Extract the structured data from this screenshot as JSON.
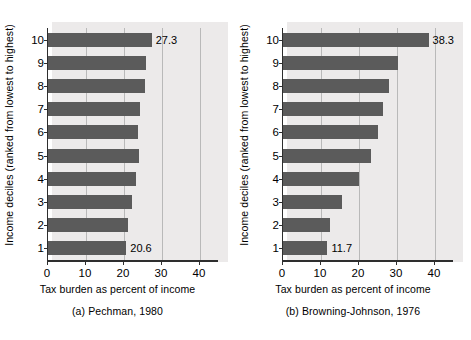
{
  "figure": {
    "background": "#ffffff",
    "bar_color": "#5b5b5b",
    "grid_color": "#b9b9b9",
    "axis_color": "#2e2e2e"
  },
  "panels": [
    {
      "key": "pechman",
      "caption": "(a) Pechman, 1980",
      "xlabel": "Tax burden as percent of income",
      "ylabel": "Income deciles (ranked from lowest to highest)"
    },
    {
      "key": "browning_johnson",
      "caption": "(b) Browning-Johnson, 1976",
      "xlabel": "Tax burden as percent of income",
      "ylabel": "Income deciles (ranked from lowest to highest)"
    }
  ],
  "chart_data": [
    {
      "type": "bar",
      "orientation": "horizontal",
      "title": "(a) Pechman, 1980",
      "xlabel": "Tax burden as percent of income",
      "ylabel": "Income deciles (ranked from lowest to highest)",
      "categories": [
        "1",
        "2",
        "3",
        "4",
        "5",
        "6",
        "7",
        "8",
        "9",
        "10"
      ],
      "values": [
        20.6,
        21.1,
        22.2,
        23.1,
        23.9,
        23.7,
        24.2,
        25.6,
        25.9,
        27.3
      ],
      "point_labels": {
        "1": "20.6",
        "10": "27.3"
      },
      "xlim": [
        0,
        45
      ],
      "xticks": [
        0,
        10,
        20,
        30,
        40
      ],
      "xticklabels": [
        "0",
        "10",
        "20",
        "30",
        "40"
      ],
      "grid": true,
      "grid_axis": "x",
      "legend": false
    },
    {
      "type": "bar",
      "orientation": "horizontal",
      "title": "(b) Browning-Johnson, 1976",
      "xlabel": "Tax burden as percent of income",
      "ylabel": "Income deciles (ranked from lowest to highest)",
      "categories": [
        "1",
        "2",
        "3",
        "4",
        "5",
        "6",
        "7",
        "8",
        "9",
        "10"
      ],
      "values": [
        11.7,
        12.4,
        15.6,
        20.0,
        23.2,
        25.0,
        26.2,
        28.0,
        30.3,
        38.3
      ],
      "point_labels": {
        "1": "11.7",
        "10": "38.3"
      },
      "xlim": [
        0,
        45
      ],
      "xticks": [
        0,
        10,
        20,
        30,
        40
      ],
      "xticklabels": [
        "0",
        "10",
        "20",
        "30",
        "40"
      ],
      "grid": true,
      "grid_axis": "x",
      "legend": false
    }
  ]
}
